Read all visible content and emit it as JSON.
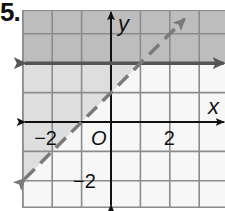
{
  "problem": {
    "number_label": "5."
  },
  "chart_data": {
    "type": "line",
    "title": "",
    "xlabel": "x",
    "ylabel": "y",
    "xlim": [
      -3,
      3.9
    ],
    "ylim": [
      -2.9,
      3.8
    ],
    "grid": true,
    "x_tick_labels": [
      {
        "value": -2,
        "label": "−2"
      },
      {
        "value": 2,
        "label": "2"
      }
    ],
    "y_tick_labels": [
      {
        "value": -2,
        "label": "−2"
      }
    ],
    "origin_label": "O",
    "series": [
      {
        "name": "boundary-solid",
        "style": "solid",
        "equation": "y = 2",
        "x": [
          -3,
          3.9
        ],
        "y": [
          2,
          2
        ],
        "color": "#555555"
      },
      {
        "name": "boundary-dashed",
        "style": "dashed",
        "equation": "y = x + 1",
        "x": [
          -3,
          2.5
        ],
        "y": [
          -2,
          3.5
        ],
        "color": "#7a7a7a"
      }
    ],
    "shaded_regions": [
      {
        "name": "above-solid",
        "inequality": "y > 2",
        "color": "#bdbdbd"
      },
      {
        "name": "above-dashed",
        "inequality": "y > x + 1",
        "color": "#dedede"
      }
    ]
  },
  "colors": {
    "axis": "#111111",
    "grid": "#8c8c8c",
    "solid_line": "#555555",
    "dashed_line": "#7a7a7a",
    "shade_dark": "#bdbdbd",
    "shade_light": "#dedede",
    "background": "#f7f7f7"
  }
}
